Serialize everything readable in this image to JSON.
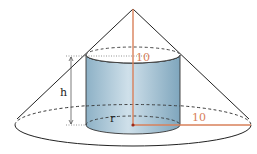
{
  "diagram": {
    "labels": {
      "cone_height": "10",
      "cone_radius": "10",
      "cylinder_height": "h",
      "cylinder_radius": "r"
    },
    "colors": {
      "outline": "#222222",
      "measure_line": "#d9805a",
      "measure_text": "#d9805a",
      "cylinder_fill_light": "#cfe0ea",
      "cylinder_fill_dark": "#7fa6bd",
      "cylinder_top": "#ffffff",
      "background": "#ffffff"
    },
    "geometry": {
      "apex": [
        133,
        9
      ],
      "cone_base": {
        "cx": 133,
        "cy": 125,
        "rx": 118,
        "ry": 21
      },
      "cylinder": {
        "cx": 133,
        "top_cy": 55,
        "bottom_cy": 125,
        "rx": 47,
        "ry": 8
      }
    }
  }
}
